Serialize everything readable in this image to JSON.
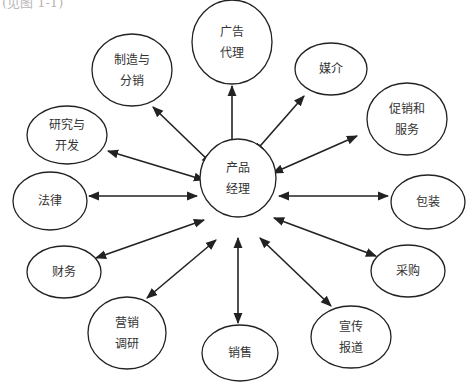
{
  "caption": "(见图 1-1)",
  "diagram": {
    "type": "hub-and-spoke",
    "center": {
      "id": "product-manager",
      "lines": [
        "产品",
        "经理"
      ]
    },
    "nodes": [
      {
        "id": "manufacturing-distribution",
        "lines": [
          "制造与",
          "分销"
        ]
      },
      {
        "id": "ad-agency",
        "lines": [
          "广告",
          "代理"
        ]
      },
      {
        "id": "media",
        "lines": [
          "媒介"
        ]
      },
      {
        "id": "promotion-service",
        "lines": [
          "促销和",
          "服务"
        ]
      },
      {
        "id": "packaging",
        "lines": [
          "包装"
        ]
      },
      {
        "id": "purchasing",
        "lines": [
          "采购"
        ]
      },
      {
        "id": "publicity",
        "lines": [
          "宣传",
          "报道"
        ]
      },
      {
        "id": "sales",
        "lines": [
          "销售"
        ]
      },
      {
        "id": "marketing-research",
        "lines": [
          "营销",
          "调研"
        ]
      },
      {
        "id": "finance",
        "lines": [
          "财务"
        ]
      },
      {
        "id": "legal",
        "lines": [
          "法律"
        ]
      },
      {
        "id": "rnd",
        "lines": [
          "研究与",
          "开发"
        ]
      }
    ],
    "edges": "bidirectional arrows between center and every node",
    "colors": {
      "stroke": "#222222",
      "text": "#333333",
      "background": "#ffffff"
    }
  }
}
